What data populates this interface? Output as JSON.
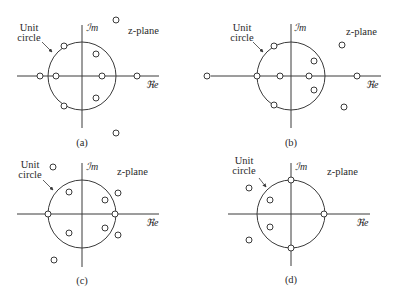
{
  "figure": {
    "panels": [
      {
        "id": "a",
        "caption": "(a)",
        "unit_label_line1": "Unit",
        "unit_label_line2": "circle",
        "im_label": "ℐm",
        "re_label": "ℜe",
        "plane_label": "z-plane",
        "origin": [
          82,
          76
        ],
        "radius": 34,
        "re_axis": [
          17,
          159
        ],
        "im_axis": [
          25,
          128
        ],
        "unit_label_pos": [
          29,
          31
        ],
        "im_label_pos": [
          86,
          31
        ],
        "re_label_pos": [
          146,
          88
        ],
        "plane_label_pos": [
          128,
          34
        ],
        "caption_pos": [
          82,
          146
        ],
        "arrow": [
          [
            42,
            42
          ],
          [
            52,
            52
          ]
        ],
        "zeros": [
          [
            40,
            76
          ],
          [
            56,
            76
          ],
          [
            102,
            76
          ],
          [
            137,
            76
          ],
          [
            64,
            46
          ],
          [
            96,
            54
          ],
          [
            96,
            98
          ],
          [
            64,
            106
          ],
          [
            116,
            20
          ],
          [
            116,
            133
          ]
        ]
      },
      {
        "id": "b",
        "caption": "(b)",
        "unit_label_line1": "Unit",
        "unit_label_line2": "circle",
        "im_label": "ℐm",
        "re_label": "ℜe",
        "plane_label": "z-plane",
        "origin": [
          291,
          76
        ],
        "radius": 34,
        "re_axis": [
          211,
          381
        ],
        "im_axis": [
          24,
          128
        ],
        "unit_label_pos": [
          242,
          31
        ],
        "im_label_pos": [
          294,
          31
        ],
        "re_label_pos": [
          366,
          88
        ],
        "plane_label_pos": [
          346,
          35
        ],
        "caption_pos": [
          291,
          146
        ],
        "arrow": [
          [
            253,
            42
          ],
          [
            263,
            52
          ]
        ],
        "zeros": [
          [
            207,
            76
          ],
          [
            257,
            76
          ],
          [
            280,
            76
          ],
          [
            309,
            76
          ],
          [
            357,
            76
          ],
          [
            274,
            46
          ],
          [
            314,
            61
          ],
          [
            314,
            90
          ],
          [
            274,
            105
          ],
          [
            342,
            45
          ],
          [
            344,
            107
          ]
        ]
      },
      {
        "id": "c",
        "caption": "(c)",
        "unit_label_line1": "Unit",
        "unit_label_line2": "circle",
        "im_label": "ℐm",
        "re_label": "ℜe",
        "plane_label": "z-plane",
        "origin": [
          82,
          214
        ],
        "radius": 34,
        "re_axis": [
          17,
          159
        ],
        "im_axis": [
          163,
          267
        ],
        "unit_label_pos": [
          30,
          168
        ],
        "im_label_pos": [
          86,
          170
        ],
        "re_label_pos": [
          146,
          226
        ],
        "plane_label_pos": [
          117,
          175
        ],
        "caption_pos": [
          82,
          284
        ],
        "arrow": [
          [
            43,
            180
          ],
          [
            53,
            190
          ]
        ],
        "zeros": [
          [
            48,
            214
          ],
          [
            115,
            214
          ],
          [
            69,
            192
          ],
          [
            105,
            200
          ],
          [
            118,
            193
          ],
          [
            69,
            233
          ],
          [
            105,
            228
          ],
          [
            118,
            235
          ],
          [
            53,
            167
          ],
          [
            54,
            260
          ]
        ]
      },
      {
        "id": "d",
        "caption": "(d)",
        "unit_label_line1": "Unit",
        "unit_label_line2": "circle",
        "im_label": "ℐm",
        "re_label": "ℜe",
        "plane_label": "z-plane",
        "origin": [
          291,
          214
        ],
        "radius": 34,
        "re_axis": [
          228,
          370
        ],
        "im_axis": [
          163,
          266
        ],
        "unit_label_pos": [
          244,
          164
        ],
        "im_label_pos": [
          295,
          170
        ],
        "re_label_pos": [
          356,
          226
        ],
        "plane_label_pos": [
          327,
          175
        ],
        "caption_pos": [
          291,
          283
        ],
        "arrow": [
          [
            259,
            178
          ],
          [
            266,
            187
          ]
        ],
        "zeros": [
          [
            291,
            180
          ],
          [
            324,
            214
          ],
          [
            291,
            248
          ],
          [
            270,
            200
          ],
          [
            270,
            227
          ],
          [
            249,
            188
          ],
          [
            249,
            240
          ]
        ]
      }
    ]
  }
}
